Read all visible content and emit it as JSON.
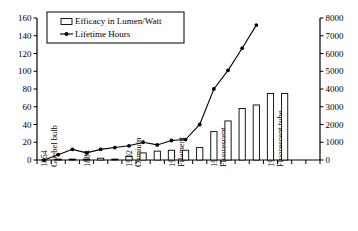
{
  "chart_data": {
    "type": "bar",
    "title": "",
    "subtitle": "",
    "xlabel": "",
    "ylabel": "",
    "y2label": "",
    "grid": false,
    "legend_position": "top-left",
    "ylim": [
      0,
      160
    ],
    "y2lim": [
      0,
      8000
    ],
    "yticks": [
      0,
      20,
      40,
      60,
      80,
      100,
      120,
      140,
      160
    ],
    "y2ticks": [
      0,
      1000,
      2000,
      3000,
      4000,
      5000,
      6000,
      7000,
      8000
    ],
    "categories": [
      "1854",
      "Goebel bulb",
      "",
      "1884",
      "",
      "1902",
      "Osmium",
      "",
      "1915",
      "Filament",
      "",
      "1949",
      "Fluorescent",
      "",
      "1970",
      "Fluorescent tube",
      "",
      "",
      "",
      ""
    ],
    "category_labels": [
      {
        "index": 0,
        "line1": "1854",
        "line2": "Goebel bulb"
      },
      {
        "index": 3,
        "line1": "1884",
        "line2": ""
      },
      {
        "index": 6,
        "line1": "1902",
        "line2": "Osmium"
      },
      {
        "index": 9,
        "line1": "1915",
        "line2": "Filament"
      },
      {
        "index": 12,
        "line1": "1949",
        "line2": "Fluorescent"
      },
      {
        "index": 16,
        "line1": "1970",
        "line2": "Fluorescent tube"
      }
    ],
    "series": [
      {
        "name": "Efficacy in Lumen/Watt",
        "type": "bar",
        "axis": "left",
        "units": "Lumen/Watt",
        "values": [
          0,
          1,
          1,
          1,
          2,
          1,
          4,
          8,
          10,
          11,
          11,
          14,
          32,
          44,
          58,
          62,
          75,
          75,
          0,
          0
        ]
      },
      {
        "name": "Lifetime Hours",
        "type": "line",
        "axis": "right",
        "units": "Hours",
        "values": [
          0,
          300,
          600,
          400,
          600,
          700,
          800,
          1000,
          850,
          1100,
          1150,
          2000,
          4000,
          5050,
          6300,
          7600,
          null,
          null,
          null,
          null
        ]
      }
    ],
    "legend": [
      {
        "label": "Efficacy in Lumen/Watt",
        "marker": "bar-swatch"
      },
      {
        "label": "Lifetime Hours",
        "marker": "line-marker"
      }
    ],
    "colors": {
      "axis": "#000000",
      "bar_fill": "#ffffff",
      "bar_stroke": "#000000",
      "line": "#000000",
      "marker": "#000000",
      "background": "#ffffff"
    }
  }
}
